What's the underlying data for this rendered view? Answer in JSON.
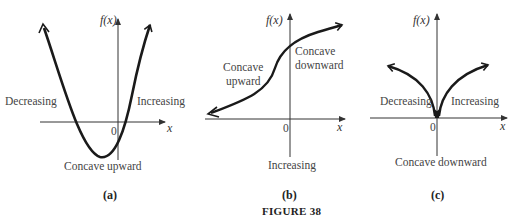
{
  "figure": {
    "caption": "FIGURE 38"
  },
  "panels": [
    {
      "id": "a",
      "caption": "(a)",
      "y_axis_label": "f(x)",
      "x_axis_label": "x",
      "origin_label": "0",
      "labels": {
        "left": "Decreasing",
        "right": "Increasing",
        "bottom": "Concave upward"
      }
    },
    {
      "id": "b",
      "caption": "(b)",
      "y_axis_label": "f(x)",
      "x_axis_label": "x",
      "origin_label": "0",
      "labels": {
        "left_line1": "Concave",
        "left_line2": "upward",
        "right_line1": "Concave",
        "right_line2": "downward",
        "bottom": "Increasing"
      }
    },
    {
      "id": "c",
      "caption": "(c)",
      "y_axis_label": "f(x)",
      "x_axis_label": "x",
      "origin_label": "0",
      "labels": {
        "left": "Decreasing",
        "right": "Increasing",
        "bottom": "Concave downward"
      }
    }
  ],
  "colors": {
    "curve": "#1a1a1a",
    "axis": "#333333",
    "text": "#444444"
  }
}
